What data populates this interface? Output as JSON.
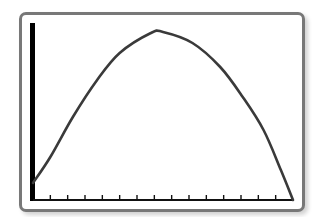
{
  "screen": {
    "frame_color": "#787878",
    "axis_color": "#000000",
    "curve_color": "#3a3a3a",
    "background": "#ffffff"
  },
  "chart_data": {
    "type": "line",
    "title": "",
    "xlabel": "",
    "ylabel": "",
    "grid": false,
    "legend": null,
    "x_tick_count": 14,
    "xlim": [
      0,
      15
    ],
    "ylim": [
      0,
      177
    ],
    "series": [
      {
        "name": "parabola",
        "x": [
          0,
          1,
          2.3,
          3.7,
          5,
          6.8,
          7.5,
          9.2,
          10.8,
          12.1,
          13.3,
          14.3,
          15
        ],
        "y": [
          17,
          43,
          83,
          120,
          147,
          167,
          168,
          157,
          133,
          103,
          70,
          30,
          0
        ]
      }
    ]
  }
}
